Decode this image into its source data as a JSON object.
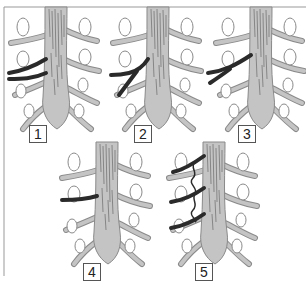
{
  "figure": {
    "colors": {
      "trunk_fill": "#c4c4c4",
      "trunk_stroke": "#8a8a8a",
      "vessel": "#2a2a2a",
      "oval_stroke": "#8a8a8a",
      "border": "#999999",
      "background": "#ffffff"
    },
    "panels": [
      {
        "label": "1",
        "variant": "two separate dark vessels arising from left side"
      },
      {
        "label": "2",
        "variant": "single dark vessel bifurcating into two"
      },
      {
        "label": "3",
        "variant": "single dark vessel bifurcating, longer stem"
      },
      {
        "label": "4",
        "variant": "single dark vessel"
      },
      {
        "label": "5",
        "variant": "three dark vessels connected by tortuous anastomotic chain"
      }
    ]
  }
}
